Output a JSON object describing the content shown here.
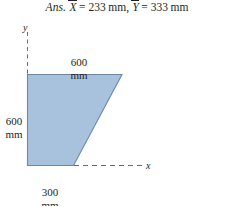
{
  "answer": {
    "prefix": "Ans.",
    "x_symbol": "X",
    "x_equals": "=",
    "x_value": "233",
    "x_unit": "mm",
    "separator": ",",
    "y_symbol": "Y",
    "y_equals": "=",
    "y_value": "333",
    "y_unit": "mm"
  },
  "figure": {
    "axis_y_label": "y",
    "axis_x_label": "x",
    "dimensions": {
      "top": {
        "value": "600",
        "unit": "mm"
      },
      "left": {
        "value": "600",
        "unit": "mm"
      },
      "bottom": {
        "value": "300",
        "unit": "mm"
      }
    },
    "shape": {
      "name": "trapezoid",
      "fill_color": "#a8c2de",
      "stroke_color": "#6f87a6"
    },
    "axis_color": "#6b6b6b"
  }
}
